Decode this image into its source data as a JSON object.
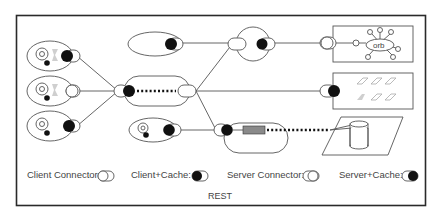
{
  "diagram": {
    "caption": "REST",
    "legend": [
      {
        "label": "Client Connector:",
        "symbol": "client-connector"
      },
      {
        "label": "Client+Cache:",
        "symbol": "client-cache"
      },
      {
        "label": "Server Connector:",
        "symbol": "server-connector"
      },
      {
        "label": "Server+Cache:",
        "symbol": "server-cache"
      }
    ],
    "nodes": {
      "user_agents": [
        "user-agent-1",
        "user-agent-2",
        "user-agent-3"
      ],
      "intermediaries": [
        "proxy-top",
        "gateway-middle",
        "cache-proxy-top",
        "cache-bottom-agent",
        "gateway-bottom"
      ],
      "origin_servers": [
        {
          "name": "orb-server",
          "text": "orb"
        },
        {
          "name": "file-server"
        },
        {
          "name": "database-server"
        }
      ]
    },
    "colors": {
      "stroke": "#555555",
      "fill_dark": "#111111",
      "frame": "#2a2a2a",
      "text": "#444444"
    }
  }
}
